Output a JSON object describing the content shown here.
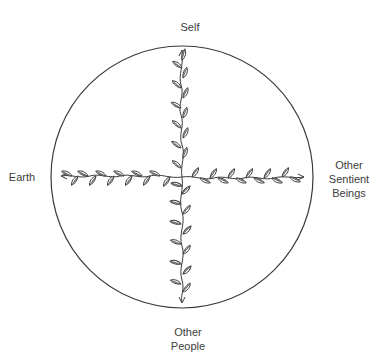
{
  "diagram": {
    "title": "",
    "circle": {
      "cx": 182,
      "cy": 177,
      "r": 131,
      "stroke": "#3a3a3a"
    },
    "center": {
      "x": 182,
      "y": 177
    },
    "axes": [
      {
        "id": "self",
        "direction": "up",
        "label": "Self",
        "end": {
          "x": 182,
          "y": 50
        }
      },
      {
        "id": "earth",
        "direction": "left",
        "label": "Earth",
        "end": {
          "x": 62,
          "y": 176
        }
      },
      {
        "id": "other-sentient-beings",
        "direction": "right",
        "label_lines": [
          "Other",
          "Sentient",
          "Beings"
        ],
        "end": {
          "x": 304,
          "y": 177
        }
      },
      {
        "id": "other-people",
        "direction": "down",
        "label_lines": [
          "Other",
          "People"
        ],
        "end": {
          "x": 182,
          "y": 302
        }
      }
    ],
    "labels": {
      "self": "Self",
      "earth": "Earth",
      "sentient_line1": "Other",
      "sentient_line2": "Sentient",
      "sentient_line3": "Beings",
      "people_line1": "Other",
      "people_line2": "People"
    },
    "motif": "leafy-vine-arrow",
    "ink_color": "#3a3a3a"
  }
}
